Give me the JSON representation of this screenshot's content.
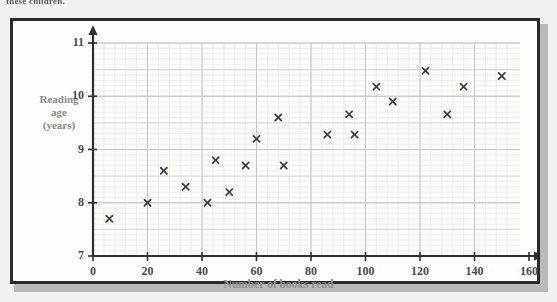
{
  "top_caption": "these children.",
  "axes": {
    "x": {
      "title": "Number of books read",
      "ticks": [
        0,
        20,
        40,
        60,
        80,
        100,
        120,
        140,
        160
      ],
      "min": 0,
      "max": 160
    },
    "y": {
      "title_lines": [
        "Reading",
        "age",
        "(years)"
      ],
      "ticks": [
        7,
        8,
        9,
        10,
        11
      ],
      "min": 7,
      "max": 11
    }
  },
  "colors": {
    "frame": "#2a2a2e",
    "grid_major": "#c6c6c6",
    "grid_minor": "#e6e6e6",
    "axis": "#2e2e32",
    "marker": "#3a3a42",
    "axis_title": "#8f8f8f",
    "tick_label": "#4b4b4b",
    "background": "#f1f1ef",
    "plot_background": "#fdfdfd"
  },
  "chart_data": {
    "type": "scatter",
    "title": "",
    "xlabel": "Number of books read",
    "ylabel": "Reading age (years)",
    "xlim": [
      0,
      160
    ],
    "ylim": [
      7,
      11
    ],
    "xticks": [
      0,
      20,
      40,
      60,
      80,
      100,
      120,
      140,
      160
    ],
    "yticks": [
      7,
      8,
      9,
      10,
      11
    ],
    "grid": true,
    "grid_minor_step_x": 4,
    "grid_minor_step_y": 0.1,
    "legend": null,
    "marker": "x",
    "points": [
      {
        "x": 6,
        "y": 7.7
      },
      {
        "x": 20,
        "y": 8.0
      },
      {
        "x": 26,
        "y": 8.6
      },
      {
        "x": 34,
        "y": 8.3
      },
      {
        "x": 42,
        "y": 8.0
      },
      {
        "x": 45,
        "y": 8.8
      },
      {
        "x": 50,
        "y": 8.2
      },
      {
        "x": 56,
        "y": 8.7
      },
      {
        "x": 60,
        "y": 9.2
      },
      {
        "x": 68,
        "y": 9.6
      },
      {
        "x": 70,
        "y": 8.7
      },
      {
        "x": 86,
        "y": 9.28
      },
      {
        "x": 94,
        "y": 9.66
      },
      {
        "x": 96,
        "y": 9.28
      },
      {
        "x": 104,
        "y": 10.18
      },
      {
        "x": 110,
        "y": 9.9
      },
      {
        "x": 122,
        "y": 10.48
      },
      {
        "x": 130,
        "y": 9.66
      },
      {
        "x": 136,
        "y": 10.18
      },
      {
        "x": 150,
        "y": 10.38
      }
    ]
  }
}
